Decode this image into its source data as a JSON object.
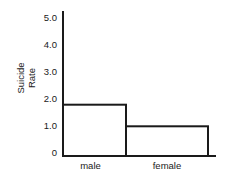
{
  "chart_data": {
    "type": "bar",
    "title": "",
    "xlabel": "",
    "ylabel": "Suicide Rate",
    "ylabel_lines": [
      "Suicide",
      "Rate"
    ],
    "categories": [
      "male",
      "female"
    ],
    "values": [
      1.9,
      1.1
    ],
    "ylim": [
      0,
      5.0
    ],
    "yticks": [
      "0",
      "1.0",
      "2.0",
      "3.0",
      "4.0",
      "5.0"
    ],
    "grid": false,
    "legend": null,
    "bar_style": "outlined, no fill, adjacent bars"
  },
  "colors": {
    "stroke": "#1a1a1a",
    "background": "#ffffff"
  }
}
